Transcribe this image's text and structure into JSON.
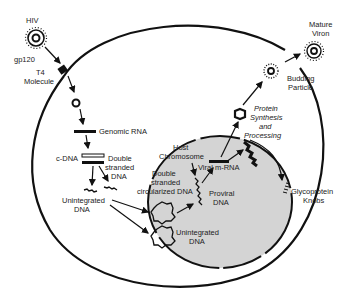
{
  "diagram": {
    "labels": {
      "hiv": "HIV",
      "gp120": "gp120",
      "t4_line1": "T4",
      "t4_line2": "Molecule",
      "genomic_rna": "Genomic RNA",
      "cdna": "c-DNA",
      "double_stranded_line1": "Double",
      "double_stranded_line2": "stranded",
      "double_stranded_line3": "DNA",
      "unintegrated_cyto_line1": "Unintegrated",
      "unintegrated_cyto_line2": "DNA",
      "host_chrom_line1": "Host",
      "host_chrom_line2": "Chromosome",
      "ds_circ_line1": "Double",
      "ds_circ_line2": "stranded",
      "ds_circ_line3": "circularized DNA",
      "viral_mrna": "Viral m-RNA",
      "proviral_line1": "Proviral",
      "proviral_line2": "DNA",
      "unintegrated_nuc_line1": "Unintegrated",
      "unintegrated_nuc_line2": "DNA",
      "protein_line1": "Protein",
      "protein_line2": "Synthesis",
      "protein_line3": "and",
      "protein_line4": "Processing",
      "budding_line1": "Budding",
      "budding_line2": "Particle",
      "mature_line1": "Mature",
      "mature_line2": "Viron",
      "glyco_line1": "Glycoprotein",
      "glyco_line2": "Knobs"
    },
    "colors": {
      "ink": "#111111",
      "nucleus_fill": "#d4d4d4",
      "background": "#ffffff"
    }
  }
}
